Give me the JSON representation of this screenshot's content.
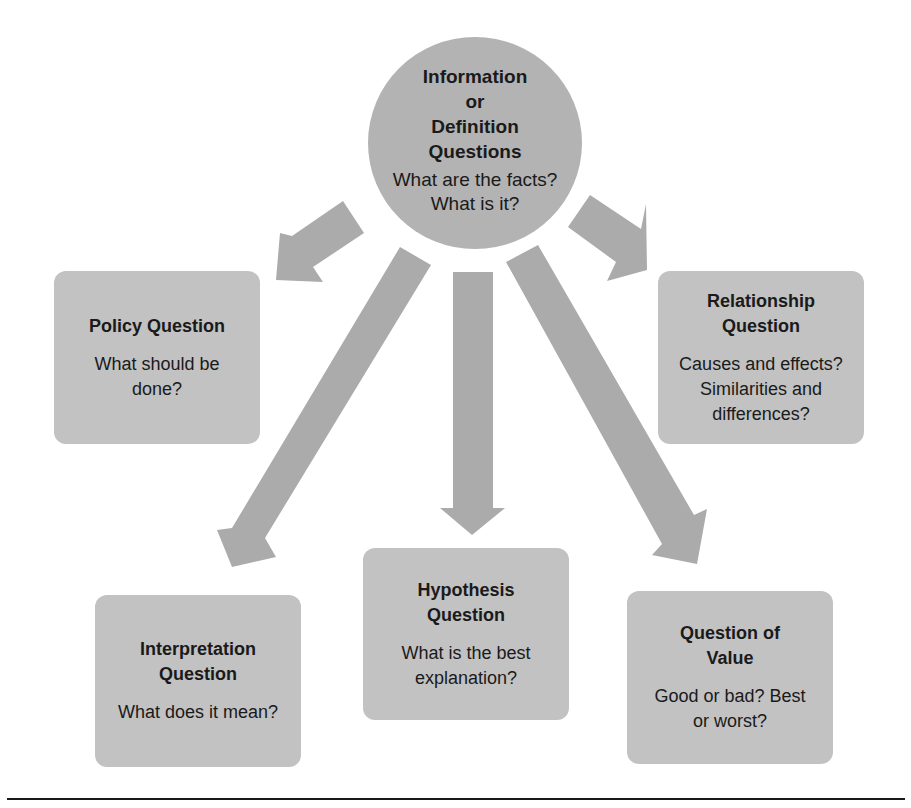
{
  "diagram": {
    "hub": {
      "title_lines": [
        "Information",
        "or",
        "Definition",
        "Questions"
      ],
      "body_lines": [
        "What are the facts?",
        "What is it?"
      ]
    },
    "nodes": [
      {
        "id": "policy",
        "title_lines": [
          "Policy Question"
        ],
        "body_lines": [
          "What should be",
          "done?"
        ]
      },
      {
        "id": "relationship",
        "title_lines": [
          "Relationship",
          "Question"
        ],
        "body_lines": [
          "Causes and effects?",
          "Similarities and",
          "differences?"
        ]
      },
      {
        "id": "interpretation",
        "title_lines": [
          "Interpretation",
          "Question"
        ],
        "body_lines": [
          "What does it mean?"
        ]
      },
      {
        "id": "hypothesis",
        "title_lines": [
          "Hypothesis",
          "Question"
        ],
        "body_lines": [
          "What is the best",
          "explanation?"
        ]
      },
      {
        "id": "value",
        "title_lines": [
          "Question of",
          "Value"
        ],
        "body_lines": [
          "Good or bad? Best",
          "or worst?"
        ]
      }
    ],
    "edges": [
      {
        "from": "hub",
        "to": "policy"
      },
      {
        "from": "hub",
        "to": "relationship"
      },
      {
        "from": "hub",
        "to": "interpretation"
      },
      {
        "from": "hub",
        "to": "hypothesis"
      },
      {
        "from": "hub",
        "to": "value"
      }
    ],
    "colors": {
      "hub_fill": "#b3b3b3",
      "box_fill": "#c2c2c2",
      "arrow_fill": "#ababab",
      "text": "#1a1a1a",
      "rule": "#1a1a1a"
    }
  }
}
